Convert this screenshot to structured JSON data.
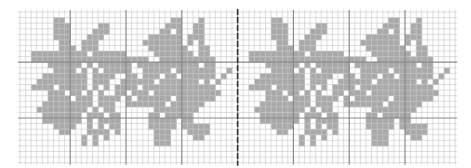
{
  "chart": {
    "cols": 78,
    "rows": 27,
    "repeat_cols": 39,
    "major_every": 10,
    "colors": {
      "background": "#ffffff",
      "minor_line": "#c8c8c8",
      "major_line": "#8a8a8a",
      "center_line": "#333333",
      "fill": "#a9a9a9"
    },
    "motif_rows": [
      ".......................................",
      "......##...................##...#......",
      "......###.....##..........###..##......",
      "......###....###.........##.#..##......",
      "......###...###........######.###......",
      ".......##..###........#######.#.#......",
      ".......###.###.........#######..##.....",
      "..##########.######.....#######.##.....",
      "..#####################..##########....",
      ".....######.#.######.###########.##....",
      "......####.#.#.#####..#####.#######..#.",
      "....########.####..##.###.##.######.#..",
      "...#########.###..######.#######.#.#...",
      "..####.#####.#.#.####.#############....",
      ".....###.##.#.#..##.###.############...",
      ".....####.###.####.#.######.#######....",
      "....#########.###..#######.######......",
      "...#########.#.##.......########.......",
      "....#######.###.##.....##.#####........",
      "....#######.#.####.....#####.##........",
      "......####..#.#.##.....#####.#####.....",
      ".......##...####.#......###...####.....",
      "...........#.#.#........###....##......",
      "...........#.#..........###............",
      ".......................................",
      ".......................................",
      "......................................."
    ]
  }
}
